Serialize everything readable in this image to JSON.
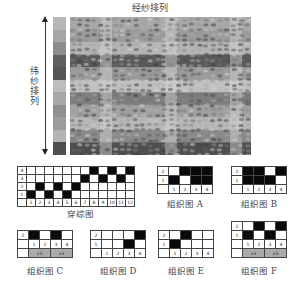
{
  "title": "经纱排列",
  "side_label": "纬纱排列",
  "color_strip": [
    "#b7b7b7",
    "#a5a5a5",
    "#8c8c8c",
    "#5f5f5f",
    "#565656",
    "#bdbdbd",
    "#a8a8a8",
    "#909090",
    "#9c9c9c",
    "#b3b3b3",
    "#4e4e4e"
  ],
  "fabric": {
    "bands": [
      "#a8a8a8",
      "#9c9c9c",
      "#b4b4b4",
      "#5a5a5a",
      "#9a9a9a",
      "#c0c0c0",
      "#7d7d7d",
      "#a0a0a0",
      "#b8b8b8",
      "#8a8a8a",
      "#4f4f4f"
    ],
    "light_columns_x": [
      30,
      95,
      160
    ]
  },
  "drafting": {
    "caption": "穿综图",
    "row_labels": [
      "4",
      "3",
      "2",
      "1"
    ],
    "col_labels": [
      "1",
      "2",
      "3",
      "4",
      "5",
      "6",
      "7",
      "8",
      "9",
      "10",
      "11",
      "12"
    ],
    "cells": [
      [
        0,
        0,
        0,
        0,
        0,
        0,
        0,
        1,
        0,
        1,
        0,
        1
      ],
      [
        0,
        0,
        0,
        0,
        0,
        0,
        1,
        0,
        1,
        0,
        1,
        0
      ],
      [
        0,
        1,
        0,
        1,
        0,
        1,
        0,
        0,
        0,
        0,
        0,
        0
      ],
      [
        1,
        0,
        1,
        0,
        1,
        0,
        0,
        0,
        0,
        0,
        0,
        0
      ]
    ]
  },
  "weaves": {
    "A": {
      "caption": "组织图 A",
      "row_labels": [
        "2",
        "1"
      ],
      "col_labels": [
        "1",
        "2",
        "3",
        "4"
      ],
      "cells": [
        [
          0,
          1,
          1,
          1
        ],
        [
          1,
          0,
          1,
          1
        ]
      ]
    },
    "B": {
      "caption": "组织图 B",
      "row_labels": [
        "2",
        "1"
      ],
      "col_labels": [
        "1",
        "2",
        "3",
        "4"
      ],
      "cells": [
        [
          1,
          1,
          0,
          1
        ],
        [
          1,
          1,
          1,
          0
        ]
      ]
    },
    "C": {
      "caption": "组织图 C",
      "row_labels": [
        "1"
      ],
      "col_labels": [
        "1",
        "2",
        "3",
        "4"
      ],
      "cells": [
        [
          1,
          0,
          1,
          0
        ]
      ],
      "multipliers": [
        "x3",
        "x3"
      ]
    },
    "D": {
      "caption": "组织图 D",
      "row_labels": [
        "2",
        "1"
      ],
      "col_labels": [
        "1",
        "2",
        "3",
        "4"
      ],
      "cells": [
        [
          0,
          0,
          0,
          1
        ],
        [
          0,
          0,
          1,
          0
        ]
      ]
    },
    "E": {
      "caption": "组织图 E",
      "row_labels": [
        "2",
        "1"
      ],
      "col_labels": [
        "1",
        "2",
        "3",
        "4"
      ],
      "cells": [
        [
          0,
          1,
          0,
          0
        ],
        [
          1,
          0,
          0,
          0
        ]
      ]
    },
    "F": {
      "caption": "组织图 F",
      "row_labels": [
        "2",
        "1"
      ],
      "col_labels": [
        "1",
        "2",
        "3",
        "4"
      ],
      "cells": [
        [
          0,
          1,
          0,
          1
        ],
        [
          1,
          0,
          1,
          0
        ]
      ],
      "multipliers": [
        "x3",
        "x3"
      ]
    }
  }
}
